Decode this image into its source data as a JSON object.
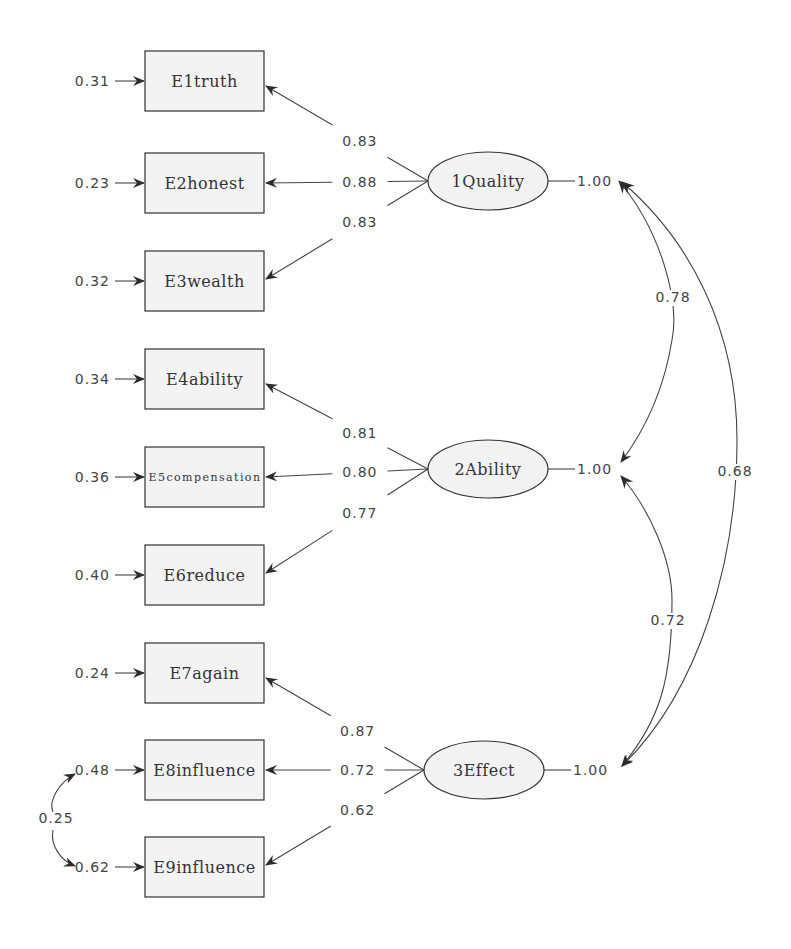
{
  "diagram": {
    "type": "confirmatory factor analysis path diagram",
    "colors": {
      "line": "#444444",
      "box_fill": "#f3f3f3",
      "ellipse_fill": "#f2f2f2",
      "text": "#333333"
    },
    "observed": [
      {
        "id": "E1",
        "label": "E1truth",
        "error_variance": "0.31",
        "y": 81
      },
      {
        "id": "E2",
        "label": "E2honest",
        "error_variance": "0.23",
        "y": 183
      },
      {
        "id": "E3",
        "label": "E3wealth",
        "error_variance": "0.32",
        "y": 281
      },
      {
        "id": "E4",
        "label": "E4ability",
        "error_variance": "0.34",
        "y": 379
      },
      {
        "id": "E5",
        "label": "E5compensation",
        "error_variance": "0.36",
        "y": 477
      },
      {
        "id": "E6",
        "label": "E6reduce",
        "error_variance": "0.40",
        "y": 575
      },
      {
        "id": "E7",
        "label": "E7again",
        "error_variance": "0.24",
        "y": 673
      },
      {
        "id": "E8",
        "label": "E8influence",
        "error_variance": "0.48",
        "y": 770
      },
      {
        "id": "E9",
        "label": "E9influence",
        "error_variance": "0.62",
        "y": 867
      }
    ],
    "latent": [
      {
        "id": "F1",
        "label": "1Quality",
        "variance": "1.00",
        "y": 181,
        "loadings": [
          {
            "to": "E1",
            "value": "0.83"
          },
          {
            "to": "E2",
            "value": "0.88"
          },
          {
            "to": "E3",
            "value": "0.83"
          }
        ]
      },
      {
        "id": "F2",
        "label": "2Ability",
        "variance": "1.00",
        "y": 469,
        "loadings": [
          {
            "to": "E4",
            "value": "0.81"
          },
          {
            "to": "E5",
            "value": "0.80"
          },
          {
            "to": "E6",
            "value": "0.77"
          }
        ]
      },
      {
        "id": "F3",
        "label": "3Effect",
        "variance": "1.00",
        "y": 770,
        "loadings": [
          {
            "to": "E7",
            "value": "0.87"
          },
          {
            "to": "E8",
            "value": "0.72"
          },
          {
            "to": "E9",
            "value": "0.62"
          }
        ]
      }
    ],
    "factor_correlations": [
      {
        "between": [
          "1Quality",
          "2Ability"
        ],
        "value": "0.78"
      },
      {
        "between": [
          "2Ability",
          "3Effect"
        ],
        "value": "0.72"
      },
      {
        "between": [
          "1Quality",
          "3Effect"
        ],
        "value": "0.68"
      }
    ],
    "error_covariances": [
      {
        "between": [
          "E8influence",
          "E9influence"
        ],
        "value": "0.25"
      }
    ]
  }
}
